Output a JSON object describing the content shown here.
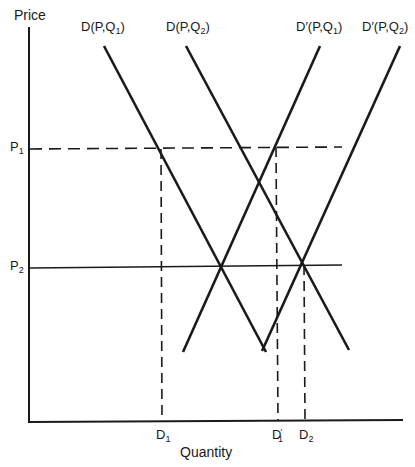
{
  "axes": {
    "y_label": "Price",
    "x_label": "Quantity"
  },
  "price_levels": [
    {
      "label": "P",
      "sub": "1",
      "style": "dashed"
    },
    {
      "label": "P",
      "sub": "2",
      "style": "solid"
    }
  ],
  "quantity_marks": [
    {
      "label": "D",
      "sub": "1",
      "prime": ""
    },
    {
      "label": "D",
      "sub": "1",
      "prime": "′"
    },
    {
      "label": "D",
      "sub": "2",
      "prime": ""
    }
  ],
  "curves": [
    {
      "name": "D(P,Q1)",
      "pre": "D(P,Q",
      "sub": "1",
      "post": ")",
      "slope": "downward"
    },
    {
      "name": "D(P,Q2)",
      "pre": "D(P,Q",
      "sub": "2",
      "post": ")",
      "slope": "downward"
    },
    {
      "name": "D'(P,Q1)",
      "pre": "D′(P,Q",
      "sub": "1",
      "post": ")",
      "slope": "upward"
    },
    {
      "name": "D'(P,Q2)",
      "pre": "D′(P,Q",
      "sub": "2",
      "post": ")",
      "slope": "upward"
    }
  ]
}
